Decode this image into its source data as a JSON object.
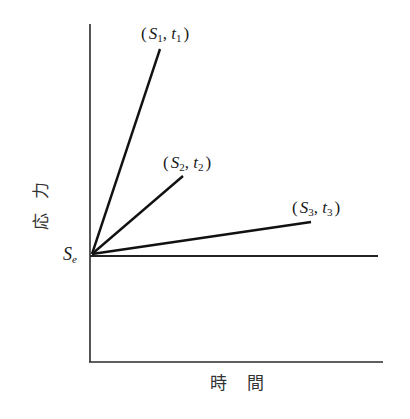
{
  "diagram": {
    "type": "stress-time schematic",
    "y_axis_label": "応力",
    "x_axis_label": "時間",
    "origin_label": {
      "symbol": "S",
      "subscript": "e"
    },
    "points": [
      {
        "id": "p1",
        "s": "S",
        "s_sub": "1",
        "t": "t",
        "t_sub": "1",
        "text": "(S1, t1)"
      },
      {
        "id": "p2",
        "s": "S",
        "s_sub": "2",
        "t": "t",
        "t_sub": "2",
        "text": "(S2, t2)"
      },
      {
        "id": "p3",
        "s": "S",
        "s_sub": "3",
        "t": "t",
        "t_sub": "3",
        "text": "(S3, t3)"
      }
    ],
    "punctuation": {
      "open": "(",
      "close": ")",
      "comma": ","
    },
    "geometry": {
      "y_axis": {
        "x": 90,
        "y_top": 24,
        "y_bottom": 362
      },
      "x_axis": {
        "y": 362,
        "x_left": 89,
        "x_right": 383
      },
      "se_line": {
        "y": 256,
        "x_left": 90,
        "x_right": 378
      },
      "ray_origin": {
        "x": 92,
        "y": 254
      },
      "rays": [
        {
          "id": "ray1",
          "x2": 160,
          "y2": 49
        },
        {
          "id": "ray2",
          "x2": 183,
          "y2": 176
        },
        {
          "id": "ray3",
          "x2": 311,
          "y2": 222
        }
      ]
    },
    "colors": {
      "background": "#ffffff",
      "ink": "#111111",
      "axis": "#2a2a2a"
    }
  }
}
